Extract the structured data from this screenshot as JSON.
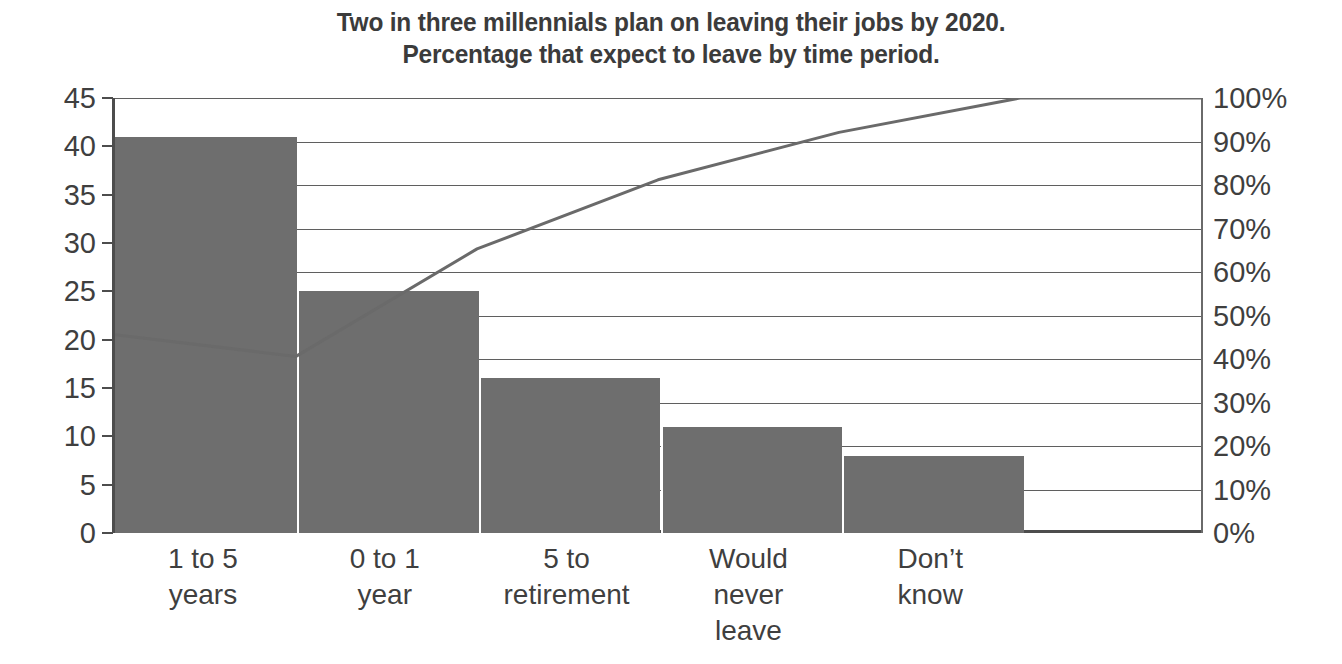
{
  "chart_data": {
    "type": "bar",
    "title": "Two in three millennials plan on leaving their jobs by 2020. Percentage that expect to leave by time period.",
    "title_lines": [
      "Two in three millennials plan on leaving their jobs by 2020.",
      "Percentage that expect to leave by time period."
    ],
    "categories": [
      "1 to 5 years",
      "0 to 1 year",
      "5 to retirement",
      "Would never leave",
      "Don’t know"
    ],
    "category_lines": [
      [
        "1 to 5",
        "years"
      ],
      [
        "0 to 1",
        "year"
      ],
      [
        "5 to",
        "retirement"
      ],
      [
        "Would",
        "never",
        "leave"
      ],
      [
        "Don’t",
        "know"
      ]
    ],
    "values": [
      41,
      25,
      16,
      11,
      8
    ],
    "cumulative_percent": [
      40.6,
      65.3,
      81.2,
      92.1,
      100.0
    ],
    "xlabel": "",
    "ylabel": "",
    "ylim": [
      0,
      45
    ],
    "y2lim": [
      0,
      100
    ],
    "yticks": [
      0,
      5,
      10,
      15,
      20,
      25,
      30,
      35,
      40,
      45
    ],
    "ytick_labels": [
      "0",
      "5",
      "10",
      "15",
      "20",
      "25",
      "30",
      "35",
      "40",
      "45"
    ],
    "y2ticks": [
      0,
      10,
      20,
      30,
      40,
      50,
      60,
      70,
      80,
      90,
      100
    ],
    "y2tick_labels": [
      "0%",
      "10%",
      "20%",
      "30%",
      "40%",
      "50%",
      "60%",
      "70%",
      "80%",
      "90%",
      "100%"
    ],
    "grid": true,
    "legend": "none",
    "series": [
      {
        "name": "Count",
        "type": "bar",
        "values": [
          41,
          25,
          16,
          11,
          8
        ],
        "axis": "left"
      },
      {
        "name": "Cumulative",
        "type": "line",
        "values": [
          40.6,
          65.3,
          81.2,
          92.1,
          100.0
        ],
        "axis": "right"
      }
    ],
    "colors": {
      "bar": "#6e6e6e",
      "line": "#6a6a6a",
      "grid": "#5f5f5f",
      "axis": "#4d4d4d",
      "text": "#3f3f3f",
      "title": "#3b3b3b",
      "background": "#ffffff"
    }
  }
}
